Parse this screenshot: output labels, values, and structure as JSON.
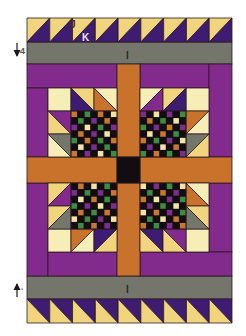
{
  "diagram": {
    "width": 246,
    "height": 336,
    "background": "#ffffff",
    "outline": "#2b1a22",
    "colors": {
      "yellow": "#f1d57e",
      "cream": "#f7edb6",
      "indigo": "#3e1c72",
      "magenta": "#832b8c",
      "orange": "#c9722c",
      "gray": "#74766b",
      "black": "#120d10",
      "green": "#3e8b44",
      "ck_purple": "#7c2e8a",
      "ck_orange": "#c8772e",
      "ck_cream": "#f3e3a6"
    },
    "rects": [
      {
        "name": "gray-band-top",
        "x": 27,
        "y": 42,
        "w": 205,
        "h": 22,
        "c": "gray"
      },
      {
        "name": "gray-band-bottom",
        "x": 27,
        "y": 276,
        "w": 205,
        "h": 23,
        "c": "gray"
      },
      {
        "name": "purple-top-band-left",
        "x": 27,
        "y": 64,
        "w": 90,
        "h": 24,
        "c": "magenta"
      },
      {
        "name": "purple-top-band-right",
        "x": 140,
        "y": 64,
        "w": 69,
        "h": 24,
        "c": "magenta"
      },
      {
        "name": "purple-right-column-upper",
        "x": 209,
        "y": 64,
        "w": 23,
        "h": 93,
        "c": "magenta"
      },
      {
        "name": "purple-right-column-lower",
        "x": 209,
        "y": 183,
        "w": 23,
        "h": 69,
        "c": "magenta"
      },
      {
        "name": "purple-left-column-upper",
        "x": 27,
        "y": 88,
        "w": 21,
        "h": 69,
        "c": "magenta"
      },
      {
        "name": "purple-left-column-lower",
        "x": 27,
        "y": 183,
        "w": 21,
        "h": 93,
        "c": "magenta"
      },
      {
        "name": "purple-bottom-band-left",
        "x": 48,
        "y": 252,
        "w": 69,
        "h": 24,
        "c": "magenta"
      },
      {
        "name": "purple-bottom-band-right",
        "x": 140,
        "y": 252,
        "w": 92,
        "h": 24,
        "c": "magenta"
      },
      {
        "name": "orange-sash-vertical-upper",
        "x": 117,
        "y": 64,
        "w": 23,
        "h": 93,
        "c": "orange"
      },
      {
        "name": "orange-sash-vertical-lower",
        "x": 117,
        "y": 183,
        "w": 23,
        "h": 93,
        "c": "orange"
      },
      {
        "name": "orange-sash-horizontal-left",
        "x": 27,
        "y": 157,
        "w": 90,
        "h": 26,
        "c": "orange"
      },
      {
        "name": "orange-sash-horizontal-right",
        "x": 140,
        "y": 157,
        "w": 92,
        "h": 26,
        "c": "orange"
      },
      {
        "name": "center-square-black",
        "x": 117,
        "y": 157,
        "w": 23,
        "h": 26,
        "c": "black"
      },
      {
        "name": "tl-block-square",
        "x": 48,
        "y": 88,
        "w": 23,
        "h": 23,
        "c": "cream"
      },
      {
        "name": "tr-block-square",
        "x": 186,
        "y": 88,
        "w": 23,
        "h": 23,
        "c": "cream"
      },
      {
        "name": "bl-block-square",
        "x": 48,
        "y": 229,
        "w": 23,
        "h": 23,
        "c": "cream"
      },
      {
        "name": "br-block-square",
        "x": 186,
        "y": 229,
        "w": 23,
        "h": 23,
        "c": "cream"
      }
    ],
    "border_rows": [
      {
        "name": "top-hst-border",
        "x": 27,
        "y": 18,
        "w": 205,
        "h": 24,
        "count": 9,
        "diag": "bltr",
        "a": "yellow",
        "b": "indigo"
      },
      {
        "name": "bottom-hst-border",
        "x": 27,
        "y": 299,
        "w": 205,
        "h": 24,
        "count": 9,
        "diag": "tlbr",
        "a": "indigo",
        "b": "yellow"
      }
    ],
    "hsts": [
      {
        "name": "tl-hst-1",
        "x": 71,
        "y": 88,
        "diag": "tlbr",
        "a": "yellow",
        "b": "indigo"
      },
      {
        "name": "tl-hst-2",
        "x": 94,
        "y": 88,
        "diag": "tlbr",
        "a": "cream",
        "b": "orange"
      },
      {
        "name": "tl-hst-3",
        "x": 48,
        "y": 111,
        "diag": "tlbr",
        "a": "magenta",
        "b": "yellow"
      },
      {
        "name": "tl-hst-4",
        "x": 48,
        "y": 134,
        "diag": "tlbr",
        "a": "gray",
        "b": "cream"
      },
      {
        "name": "tr-hst-1",
        "x": 140,
        "y": 88,
        "diag": "bltr",
        "a": "cream",
        "b": "magenta"
      },
      {
        "name": "tr-hst-2",
        "x": 163,
        "y": 88,
        "diag": "bltr",
        "a": "yellow",
        "b": "indigo"
      },
      {
        "name": "tr-hst-3",
        "x": 186,
        "y": 111,
        "diag": "bltr",
        "a": "orange",
        "b": "cream"
      },
      {
        "name": "tr-hst-4",
        "x": 186,
        "y": 134,
        "diag": "bltr",
        "a": "gray",
        "b": "yellow"
      },
      {
        "name": "bl-hst-1",
        "x": 48,
        "y": 183,
        "diag": "bltr",
        "a": "yellow",
        "b": "magenta"
      },
      {
        "name": "bl-hst-2",
        "x": 48,
        "y": 206,
        "diag": "bltr",
        "a": "yellow",
        "b": "gray"
      },
      {
        "name": "bl-hst-3",
        "x": 71,
        "y": 229,
        "diag": "bltr",
        "a": "orange",
        "b": "cream"
      },
      {
        "name": "bl-hst-4",
        "x": 94,
        "y": 229,
        "diag": "bltr",
        "a": "indigo",
        "b": "yellow"
      },
      {
        "name": "br-hst-1",
        "x": 186,
        "y": 183,
        "diag": "tlbr",
        "a": "cream",
        "b": "orange"
      },
      {
        "name": "br-hst-2",
        "x": 186,
        "y": 206,
        "diag": "tlbr",
        "a": "yellow",
        "b": "gray"
      },
      {
        "name": "br-hst-3",
        "x": 140,
        "y": 229,
        "diag": "tlbr",
        "a": "indigo",
        "b": "yellow"
      },
      {
        "name": "br-hst-4",
        "x": 163,
        "y": 229,
        "diag": "tlbr",
        "a": "magenta",
        "b": "yellow"
      }
    ],
    "hst_size": 23,
    "checkerboards": [
      {
        "name": "tl-checkerboard",
        "x": 71,
        "y": 111,
        "size": 46,
        "rows": [
          "OKGKOKC",
          "KGKPKOK",
          "PKCKGKP",
          "KOKPKCK",
          "GKOKGKO",
          "KCKPKGK",
          "OKPKCKG"
        ]
      },
      {
        "name": "tr-checkerboard",
        "x": 140,
        "y": 111,
        "size": 46,
        "rows": [
          "PKCKPKG",
          "KOKGKCK",
          "GKPKOKP",
          "KCKOKGK",
          "OKGKPKC",
          "KPKCKOK",
          "GKOKGKP"
        ]
      },
      {
        "name": "bl-checkerboard",
        "x": 71,
        "y": 183,
        "size": 46,
        "rows": [
          "KOKCKGK",
          "PKGKPKO",
          "KCKOKGK",
          "GKPKCKP",
          "KOKGKOK",
          "CKGKPKC",
          "KGKOKPK"
        ]
      },
      {
        "name": "br-checkerboard",
        "x": 140,
        "y": 183,
        "size": 46,
        "rows": [
          "CKPKGKC",
          "KGKOKPK",
          "OKCKPKG",
          "KPKGKCK",
          "CKOKPKG",
          "KGKCKOK",
          "OKGKPKO"
        ]
      }
    ],
    "checker_map": {
      "G": "green",
      "P": "ck_purple",
      "O": "ck_orange",
      "C": "ck_cream",
      "K": "black"
    }
  },
  "labels": {
    "j": "J",
    "k": "K",
    "i_top": "I",
    "i_bottom": "I",
    "four": "4",
    "bottom_mark": "‘"
  },
  "label_colors": {
    "j": "#3a2a1e",
    "k": "#ece3f3",
    "i": "#2a2a26",
    "arrow": "#1a1a1a"
  }
}
